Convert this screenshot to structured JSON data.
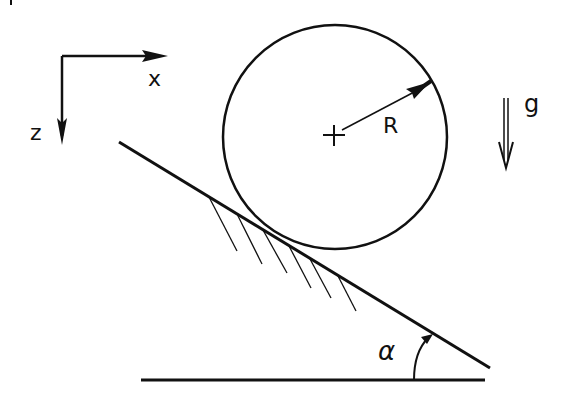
{
  "diagram": {
    "axes": {
      "x_label": "x",
      "z_label": "z"
    },
    "cylinder": {
      "radius_label": "R"
    },
    "gravity": {
      "label": "g"
    },
    "incline": {
      "angle_label": "α"
    },
    "colors": {
      "ink": "#111111",
      "background": "#ffffff"
    }
  }
}
